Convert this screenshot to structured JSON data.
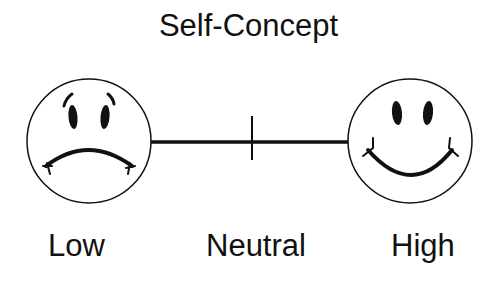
{
  "title": "Self-Concept",
  "scale": {
    "labels": {
      "low": "Low",
      "neutral": "Neutral",
      "high": "High"
    },
    "left_icon": "sad-face-icon",
    "right_icon": "happy-face-icon"
  },
  "colors": {
    "stroke": "#111111",
    "background": "#ffffff"
  }
}
